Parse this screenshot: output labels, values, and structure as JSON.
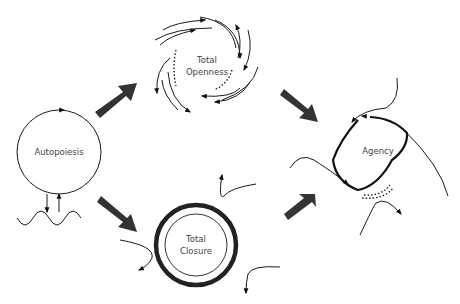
{
  "diagram": {
    "nodes": {
      "autopoiesis": {
        "label": "Autopoiesis"
      },
      "openness": {
        "line1": "Total",
        "line2": "Openness"
      },
      "closure": {
        "line1": "Total",
        "line2": "Closure"
      },
      "agency": {
        "label": "Agency"
      }
    },
    "edges": [
      {
        "from": "Autopoiesis",
        "to": "Total Openness"
      },
      {
        "from": "Autopoiesis",
        "to": "Total Closure"
      },
      {
        "from": "Total Openness",
        "to": "Agency"
      },
      {
        "from": "Total Closure",
        "to": "Agency"
      }
    ],
    "colors": {
      "line": "#1a1a1a",
      "big_arrow": "#333333",
      "text": "#444444",
      "background": "#ffffff"
    }
  }
}
